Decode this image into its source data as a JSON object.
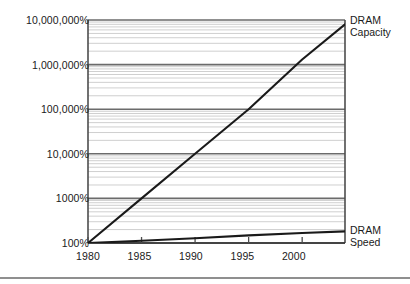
{
  "figure": {
    "background_color": "#ffffff",
    "line_color": "#1a1a1a",
    "major_grid_color": "#6b6b6b",
    "minor_grid_color": "#c9c9c9",
    "axis_color": "#4d4d4d",
    "bottom_rule_color": "#8f8f8f"
  },
  "chart_data": {
    "type": "line",
    "title": "",
    "xlabel": "",
    "ylabel": "",
    "yscale": "log",
    "ylim": [
      100,
      10000000
    ],
    "xlim": [
      1980,
      2004
    ],
    "grid": true,
    "minor_grid": true,
    "legend_position": "right-inline",
    "y_tick_labels": [
      "10,000,000%",
      "1,000,000%",
      "100,000%",
      "10,000%",
      "1000%",
      "100%"
    ],
    "y_tick_values": [
      10000000,
      1000000,
      100000,
      10000,
      1000,
      100
    ],
    "x_tick_labels": [
      "1980",
      "1985",
      "1990",
      "1995",
      "2000"
    ],
    "x_tick_values": [
      1980,
      1985,
      1990,
      1995,
      2000
    ],
    "series": [
      {
        "name": "DRAM Capacity",
        "label_line1": "DRAM",
        "label_line2": "Capacity",
        "x": [
          1980,
          1985,
          1990,
          1995,
          2000,
          2004
        ],
        "values": [
          100,
          1000,
          10000,
          100000,
          1300000,
          8000000
        ]
      },
      {
        "name": "DRAM Speed",
        "label_line1": "DRAM",
        "label_line2": "Speed",
        "x": [
          1980,
          1985,
          1990,
          1995,
          2000,
          2004
        ],
        "values": [
          100,
          112,
          128,
          148,
          167,
          182
        ]
      }
    ]
  },
  "labels": {
    "y": {
      "t10m": "10,000,000%",
      "t1m": "1,000,000%",
      "t100k": "100,000%",
      "t10k": "10,000%",
      "t1k": "1000%",
      "t100": "100%"
    },
    "x": {
      "x1980": "1980",
      "x1985": "1985",
      "x1990": "1990",
      "x1995": "1995",
      "x2000": "2000"
    },
    "capacity_line1": "DRAM",
    "capacity_line2": "Capacity",
    "speed_line1": "DRAM",
    "speed_line2": "Speed"
  }
}
